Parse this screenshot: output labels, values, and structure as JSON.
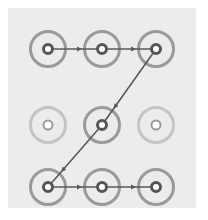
{
  "pattern_lock": {
    "grid_size": 3,
    "nodes": [
      {
        "id": 1,
        "row": 0,
        "col": 0,
        "x": 48,
        "y": 49,
        "active": true
      },
      {
        "id": 2,
        "row": 0,
        "col": 1,
        "x": 102,
        "y": 49,
        "active": true
      },
      {
        "id": 3,
        "row": 0,
        "col": 2,
        "x": 156,
        "y": 49,
        "active": true
      },
      {
        "id": 4,
        "row": 1,
        "col": 0,
        "x": 48,
        "y": 125,
        "active": false
      },
      {
        "id": 5,
        "row": 1,
        "col": 1,
        "x": 102,
        "y": 125,
        "active": true
      },
      {
        "id": 6,
        "row": 1,
        "col": 2,
        "x": 156,
        "y": 125,
        "active": false
      },
      {
        "id": 7,
        "row": 2,
        "col": 0,
        "x": 48,
        "y": 187,
        "active": true
      },
      {
        "id": 8,
        "row": 2,
        "col": 1,
        "x": 102,
        "y": 187,
        "active": true
      },
      {
        "id": 9,
        "row": 2,
        "col": 2,
        "x": 156,
        "y": 187,
        "active": true
      }
    ],
    "path": [
      1,
      2,
      3,
      5,
      7,
      8,
      9
    ],
    "colors": {
      "background": "#ffffff",
      "panel": "#ececec",
      "active_ring": "#9a9a9a",
      "inactive_ring": "#c4c4c4",
      "active_dot": "#555555",
      "inactive_dot": "#9a9a9a",
      "line": "#5a5a5a"
    }
  }
}
